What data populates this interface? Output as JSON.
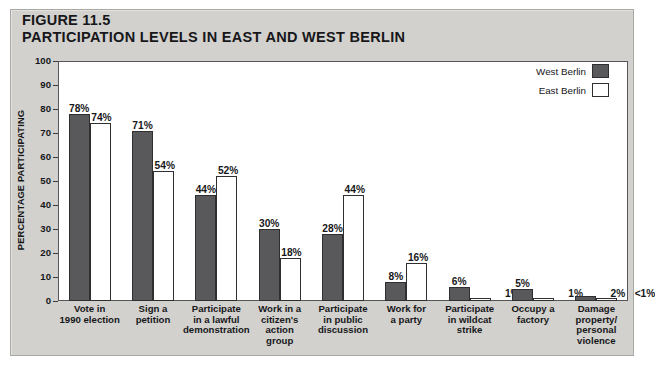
{
  "figure": {
    "number_label": "FIGURE 11.5",
    "number_prefix": "F",
    "number_rest": "IGURE 11.5",
    "title": "PARTICIPATION LEVELS IN EAST AND WEST BERLIN"
  },
  "legend": {
    "position": "top-right",
    "items": [
      {
        "label": "West Berlin",
        "color": "#59595c"
      },
      {
        "label": "East Berlin",
        "color": "#ffffff"
      }
    ]
  },
  "axes": {
    "ylabel": "PERCENTAGE PARTICIPATING",
    "yticks": [
      "100",
      "90",
      "80",
      "70",
      "60",
      "50",
      "40",
      "30",
      "20",
      "10",
      "0"
    ],
    "ymin": 0,
    "ymax": 100
  },
  "chart_data": {
    "type": "bar",
    "title": "PARTICIPATION LEVELS IN EAST AND WEST BERLIN",
    "xlabel": "",
    "ylabel": "PERCENTAGE PARTICIPATING",
    "ylim": [
      0,
      100
    ],
    "yticks": [
      0,
      10,
      20,
      30,
      40,
      50,
      60,
      70,
      80,
      90,
      100
    ],
    "grid": false,
    "legend_position": "top-right",
    "categories": [
      "Vote in\n1990 election",
      "Sign a\npetition",
      "Participate\nin a lawful\ndemonstration",
      "Work in a\ncitizen's\naction\ngroup",
      "Participate\nin public\ndiscussion",
      "Work for\na party",
      "Participate\nin wildcat\nstrike",
      "Occupy a\nfactory",
      "Damage\nproperty/\npersonal\nviolence"
    ],
    "series": [
      {
        "name": "West Berlin",
        "color": "#59595c",
        "values": [
          78,
          71,
          44,
          30,
          28,
          8,
          6,
          5,
          2
        ],
        "labels": [
          "78%",
          "71%",
          "44%",
          "30%",
          "28%",
          "8%",
          "6%",
          "5%",
          "2%"
        ]
      },
      {
        "name": "East Berlin",
        "color": "#ffffff",
        "values": [
          74,
          54,
          52,
          18,
          44,
          16,
          1,
          1,
          0.5
        ],
        "labels": [
          "74%",
          "54%",
          "52%",
          "18%",
          "44%",
          "16%",
          "1%",
          "1%",
          "<1%"
        ]
      }
    ]
  },
  "x_labels": [
    [
      "Vote in",
      "1990 election"
    ],
    [
      "Sign a",
      "petition"
    ],
    [
      "Participate",
      "in a lawful",
      "demonstration"
    ],
    [
      "Work in a",
      "citizen's",
      "action",
      "group"
    ],
    [
      "Participate",
      "in public",
      "discussion"
    ],
    [
      "Work for",
      "a party"
    ],
    [
      "Participate",
      "in wildcat",
      "strike"
    ],
    [
      "Occupy a",
      "factory"
    ],
    [
      "Damage",
      "property/",
      "personal",
      "violence"
    ]
  ],
  "colors": {
    "panel_background": "#d2d1cd",
    "plot_background": "#ffffff",
    "axis": "#55555a",
    "west_bar": "#59595c",
    "east_bar": "#ffffff",
    "text": "#17171a"
  }
}
